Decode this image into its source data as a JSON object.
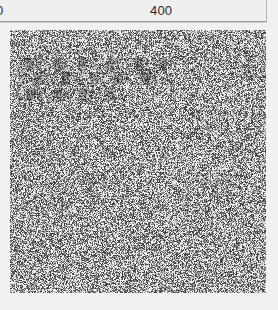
{
  "page": {
    "background_color": "#f1f1f1",
    "width": 278,
    "height": 310
  },
  "header": {
    "name": "horizontal-ruler",
    "background_color": "#efefef",
    "border_color": "#9a9a9a",
    "ticks": [
      {
        "label": "0",
        "x": 0
      },
      {
        "label": "400",
        "x": 400
      }
    ],
    "origin_label": "0",
    "mid_label": "400"
  },
  "noise_panel": {
    "name": "noise-image",
    "x": 10,
    "y": 30,
    "width": 256,
    "height": 263,
    "description": "dense grayscale salt-and-pepper noise",
    "density": 0.5,
    "dark_color": "#4a4a4a",
    "light_color": "#ededed",
    "overlay_text": [
      "░▓▒░ ▓▒░▓ ▒░▓▒ ░▓▒░▓",
      "▒░▓▒░ ▓▒░ ▓▒░▓▒ ░▓▒░",
      "░▓▒ ░▓▒░▓▒ ░▓"
    ]
  },
  "footer": {
    "background_color": "#f1f1f1"
  }
}
